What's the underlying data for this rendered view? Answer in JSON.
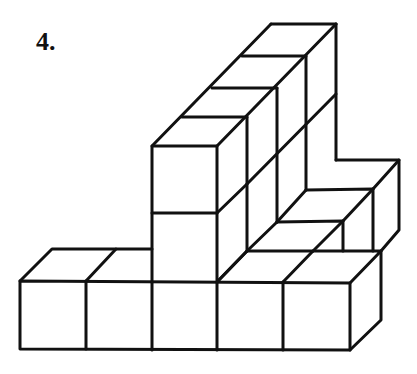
{
  "problem": {
    "number_label": "4."
  },
  "figure": {
    "type": "isometric cube structure",
    "stroke_color": "#111111",
    "background": "#ffffff",
    "bottom_row_cubes": 5,
    "tower_height": 2,
    "back_wall_cubes_top": 4,
    "right_step_cubes": 2
  }
}
